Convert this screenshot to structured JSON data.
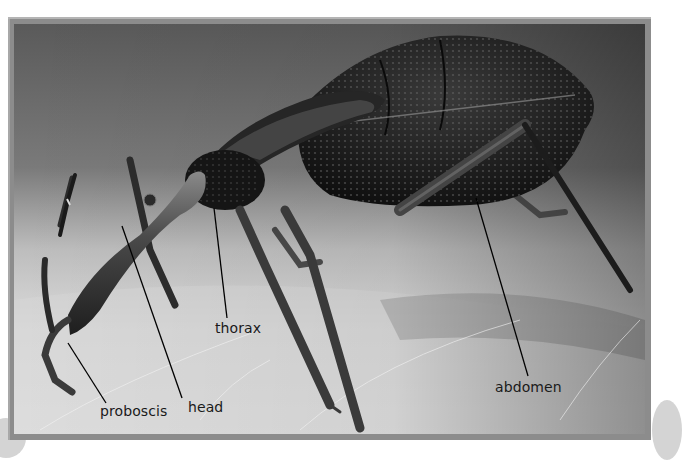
{
  "figure": {
    "colors": {
      "frame": "#8c8c8c",
      "frame_highlight": "#b4b4b4",
      "background_top": "#5a5a5a",
      "skin_light": "#e2e2e2",
      "insect_body": "#161616",
      "label_text": "#1a1a1a",
      "leader_line": "#000000"
    },
    "labels": [
      {
        "id": "proboscis",
        "text": "proboscis",
        "x": 100,
        "y": 404,
        "line": {
          "x1": 68,
          "y1": 343,
          "x2": 106,
          "y2": 403
        }
      },
      {
        "id": "head",
        "text": "head",
        "x": 188,
        "y": 398,
        "line": {
          "x1": 122,
          "y1": 226,
          "x2": 182,
          "y2": 398
        }
      },
      {
        "id": "thorax",
        "text": "thorax",
        "x": 215,
        "y": 320,
        "line": {
          "x1": 214,
          "y1": 208,
          "x2": 227,
          "y2": 318
        }
      },
      {
        "id": "abdomen",
        "text": "abdomen",
        "x": 495,
        "y": 380,
        "line": {
          "x1": 476,
          "y1": 198,
          "x2": 528,
          "y2": 376
        }
      }
    ]
  }
}
